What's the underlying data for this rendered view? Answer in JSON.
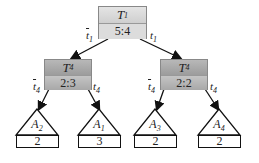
{
  "root": {
    "name": "T",
    "sub": "1",
    "value": "5:4",
    "left_edge": "t",
    "left_sub": "1",
    "right_edge": "t",
    "right_sub": "1"
  },
  "left": {
    "name": "T",
    "sub": "4",
    "value": "2:3",
    "left_edge": "t",
    "left_sub": "4",
    "right_edge": "t",
    "right_sub": "4"
  },
  "right": {
    "name": "T",
    "sub": "4",
    "value": "2:2",
    "left_edge": "t",
    "left_sub": "4",
    "right_edge": "t",
    "right_sub": "4"
  },
  "leaves": [
    {
      "name": "A",
      "sub": "2",
      "value": "2"
    },
    {
      "name": "A",
      "sub": "1",
      "value": "3"
    },
    {
      "name": "A",
      "sub": "3",
      "value": "2"
    },
    {
      "name": "A",
      "sub": "4",
      "value": "2"
    }
  ]
}
